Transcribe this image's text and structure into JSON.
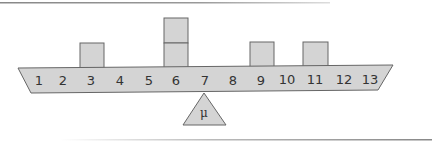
{
  "diagram": {
    "type": "balance-beam",
    "positions": [
      "1",
      "2",
      "3",
      "4",
      "5",
      "6",
      "7",
      "8",
      "9",
      "10",
      "11",
      "12",
      "13"
    ],
    "weights": [
      {
        "position": 3,
        "count": 1
      },
      {
        "position": 6,
        "count": 2
      },
      {
        "position": 9,
        "count": 1
      },
      {
        "position": 11,
        "count": 1
      }
    ],
    "fulcrum": {
      "label": "μ",
      "position": 7
    },
    "colors": {
      "fill": "#d4d4d4",
      "stroke": "#666666",
      "text": "#333333"
    }
  }
}
